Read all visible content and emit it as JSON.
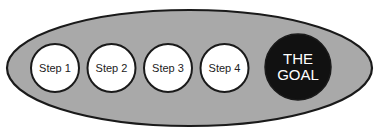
{
  "diagram": {
    "type": "process-to-goal",
    "container_fill": "#a9a9a9",
    "outline_color": "#1a1a1a",
    "step_fill": "#ffffff",
    "goal_fill": "#111111",
    "steps": [
      {
        "label": "Step 1"
      },
      {
        "label": "Step 2"
      },
      {
        "label": "Step 3"
      },
      {
        "label": "Step 4"
      }
    ],
    "goal": {
      "line1": "THE",
      "line2": "GOAL"
    }
  }
}
